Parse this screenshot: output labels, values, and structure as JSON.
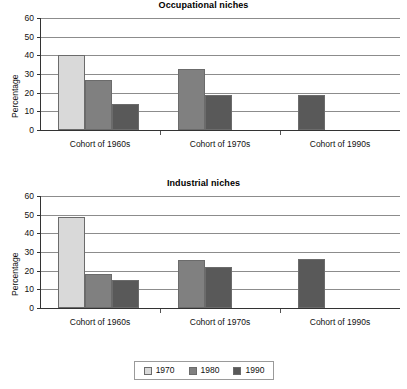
{
  "chart_data": [
    {
      "type": "bar",
      "title": "Occupational niches",
      "xlabel": "",
      "ylabel": "Percentage",
      "ylim": [
        0,
        60
      ],
      "ytick_step": 10,
      "yticks": [
        0,
        10,
        20,
        30,
        40,
        50,
        60
      ],
      "grid": true,
      "legend_position": "bottom",
      "categories": [
        "Cohort of 1960s",
        "Cohort of 1970s",
        "Cohort of 1990s"
      ],
      "series": [
        {
          "name": "1970",
          "color": "#d9d9d9",
          "values": [
            40,
            null,
            null
          ]
        },
        {
          "name": "1980",
          "color": "#808080",
          "values": [
            27,
            32.5,
            null
          ]
        },
        {
          "name": "1990",
          "color": "#595959",
          "values": [
            14,
            18.5,
            18.5
          ]
        }
      ]
    },
    {
      "type": "bar",
      "title": "Industrial niches",
      "xlabel": "",
      "ylabel": "Percentage",
      "ylim": [
        0,
        60
      ],
      "ytick_step": 10,
      "yticks": [
        0,
        10,
        20,
        30,
        40,
        50,
        60
      ],
      "grid": true,
      "legend_position": "bottom",
      "categories": [
        "Cohort of 1960s",
        "Cohort of 1970s",
        "Cohort of 1990s"
      ],
      "series": [
        {
          "name": "1970",
          "color": "#d9d9d9",
          "values": [
            49,
            null,
            null
          ]
        },
        {
          "name": "1980",
          "color": "#808080",
          "values": [
            18,
            25.5,
            null
          ]
        },
        {
          "name": "1990",
          "color": "#595959",
          "values": [
            15,
            22,
            26.5
          ]
        }
      ]
    }
  ],
  "legend": {
    "items": [
      {
        "label": "1970",
        "color": "#d9d9d9"
      },
      {
        "label": "1980",
        "color": "#808080"
      },
      {
        "label": "1990",
        "color": "#595959"
      }
    ]
  }
}
